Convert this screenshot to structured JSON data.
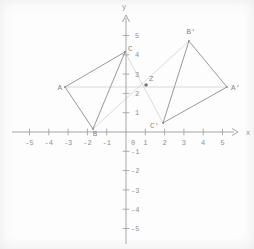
{
  "figure": {
    "type": "coordinate-plane-geometry",
    "x_axis": {
      "label": "x",
      "tick_values": [
        -5,
        -4,
        -3,
        -2,
        -1,
        0,
        1,
        2,
        3,
        4,
        5
      ],
      "tick_labels": [
        "-5",
        "-4",
        "-3",
        "-2",
        "-1",
        "0",
        "1",
        "2",
        "3",
        "4",
        "5"
      ],
      "range": [
        -5.9,
        5.8
      ]
    },
    "y_axis": {
      "label": "y",
      "tick_values": [
        -5,
        -4,
        -3,
        -2,
        -1,
        1,
        2,
        3,
        4,
        5
      ],
      "tick_labels": [
        "-5",
        "-4",
        "-3",
        "-2",
        "-1",
        "1",
        "2",
        "3",
        "4",
        "5"
      ],
      "range": [
        -5.8,
        6.0
      ]
    },
    "points": [
      {
        "label": "A",
        "x": -3.16,
        "y": 2.33,
        "label_anchor": "end",
        "label_offset": [
          -3,
          2.5
        ]
      },
      {
        "label": "B",
        "x": -1.71,
        "y": 0.16,
        "label_anchor": "middle",
        "label_offset": [
          2,
          7.5
        ]
      },
      {
        "label": "C",
        "x": -0.05,
        "y": 4.15,
        "label_anchor": "start",
        "label_offset": [
          3,
          -1
        ]
      },
      {
        "label": "Z",
        "x": 1.04,
        "y": 2.44,
        "label_anchor": "start",
        "label_offset": [
          3,
          -3.5
        ],
        "emphasis": true
      },
      {
        "label": "A'",
        "x": 5.23,
        "y": 2.33,
        "label_anchor": "start",
        "label_offset": [
          4,
          2.5
        ]
      },
      {
        "label": "B'",
        "x": 3.26,
        "y": 4.71,
        "label_anchor": "middle",
        "label_offset": [
          2,
          -7.5
        ]
      },
      {
        "label": "C'",
        "x": 1.92,
        "y": 0.47,
        "label_anchor": "end",
        "label_offset": [
          -4,
          5.5
        ]
      }
    ],
    "triangles": [
      {
        "name": "ABC",
        "vertices": [
          "A",
          "B",
          "C"
        ]
      },
      {
        "name": "A'B'C'",
        "vertices": [
          "A'",
          "B'",
          "C'"
        ]
      }
    ],
    "connectors": [
      [
        "A",
        "A'"
      ],
      [
        "B",
        "B'"
      ],
      [
        "C",
        "C'"
      ]
    ],
    "colors": {
      "background": "#fdfdfd",
      "axis": "#9b9b9b",
      "tick_label": "#8f8f8f",
      "edge": "#8d8d8d",
      "connector": "#d2d2d2",
      "point_label": "#858585",
      "dot": "#707070"
    }
  }
}
